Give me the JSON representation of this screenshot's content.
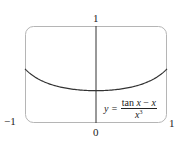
{
  "chart_data": {
    "type": "line",
    "title": "",
    "function": "y = (tan x - x) / x^3",
    "xlabel": "",
    "ylabel": "",
    "xlim": [
      -1,
      1
    ],
    "ylim": [
      0,
      1
    ],
    "grid": false,
    "legend": null,
    "x_tick_labels": [
      "-1",
      "0",
      "1"
    ],
    "y_tick_labels": [
      "1"
    ],
    "x": [
      -1.0,
      -0.75,
      -0.5,
      -0.25,
      0.0,
      0.25,
      0.5,
      0.75,
      1.0
    ],
    "series": [
      {
        "name": "y = (tan x - x)/x^3",
        "values": [
          0.557,
          0.434,
          0.369,
          0.342,
          0.333,
          0.342,
          0.369,
          0.434,
          0.557
        ]
      }
    ],
    "annotations": [
      {
        "text": "y = (tan x − x)/x³",
        "position": "lower right inside box"
      }
    ]
  },
  "labels": {
    "y_top": "1",
    "x_origin": "0",
    "x_left": "−1",
    "x_right": "1",
    "formula_y": "y =",
    "formula_num_tan": "tan ",
    "formula_num_x1": "x",
    "formula_num_minus": " − ",
    "formula_num_x2": "x",
    "formula_den_x": "x",
    "formula_den_exp": "3"
  },
  "colors": {
    "curve": "#333333",
    "axis": "#333333",
    "box": "#b5b5b5",
    "text": "#222222"
  }
}
